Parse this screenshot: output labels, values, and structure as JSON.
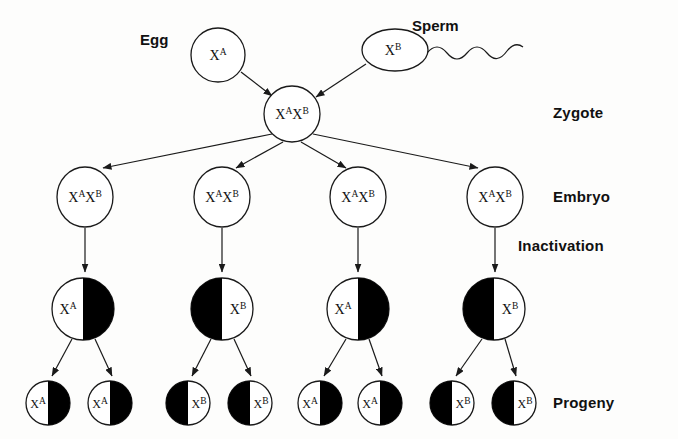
{
  "figure": {
    "background_color": "#fdfdfc",
    "ink_color": "#1a1a1a",
    "inactive_fill_color": "#000000",
    "active_fill_color": "#ffffff"
  },
  "labels": {
    "egg": "Egg",
    "sperm": "Sperm",
    "zygote": "Zygote",
    "embryo": "Embryo",
    "inactivation": "Inactivation",
    "progeny": "Progeny"
  },
  "allele_symbols": {
    "base": "X",
    "a": "A",
    "b": "B"
  },
  "gametes": [
    {
      "id": "egg",
      "base": "X",
      "sup": "A",
      "label": "Egg",
      "shape": "circle"
    },
    {
      "id": "sperm",
      "base": "X",
      "sup": "B",
      "label": "Sperm",
      "shape": "ellipse-with-tail"
    }
  ],
  "zygote": {
    "genotype_parts": [
      {
        "base": "X",
        "sup": "A"
      },
      {
        "base": "X",
        "sup": "B"
      }
    ],
    "label": "Zygote"
  },
  "embryos": [
    {
      "index": 1,
      "genotype_parts": [
        {
          "base": "X",
          "sup": "A"
        },
        {
          "base": "X",
          "sup": "B"
        }
      ]
    },
    {
      "index": 2,
      "genotype_parts": [
        {
          "base": "X",
          "sup": "A"
        },
        {
          "base": "X",
          "sup": "B"
        }
      ]
    },
    {
      "index": 3,
      "genotype_parts": [
        {
          "base": "X",
          "sup": "A"
        },
        {
          "base": "X",
          "sup": "B"
        }
      ]
    },
    {
      "index": 4,
      "genotype_parts": [
        {
          "base": "X",
          "sup": "A"
        },
        {
          "base": "X",
          "sup": "B"
        }
      ]
    }
  ],
  "inactivation_cells": [
    {
      "index": 1,
      "active_allele_base": "X",
      "active_allele_sup": "A",
      "black_half": "right"
    },
    {
      "index": 2,
      "active_allele_base": "X",
      "active_allele_sup": "B",
      "black_half": "left"
    },
    {
      "index": 3,
      "active_allele_base": "X",
      "active_allele_sup": "A",
      "black_half": "right"
    },
    {
      "index": 4,
      "active_allele_base": "X",
      "active_allele_sup": "B",
      "black_half": "left"
    }
  ],
  "progeny_cells": [
    {
      "index": 1,
      "active_allele_base": "X",
      "active_allele_sup": "A",
      "black_half": "right",
      "parent": 1
    },
    {
      "index": 2,
      "active_allele_base": "X",
      "active_allele_sup": "A",
      "black_half": "right",
      "parent": 1
    },
    {
      "index": 3,
      "active_allele_base": "X",
      "active_allele_sup": "B",
      "black_half": "left",
      "parent": 2
    },
    {
      "index": 4,
      "active_allele_base": "X",
      "active_allele_sup": "B",
      "black_half": "left",
      "parent": 2
    },
    {
      "index": 5,
      "active_allele_base": "X",
      "active_allele_sup": "A",
      "black_half": "right",
      "parent": 3
    },
    {
      "index": 6,
      "active_allele_base": "X",
      "active_allele_sup": "A",
      "black_half": "right",
      "parent": 3
    },
    {
      "index": 7,
      "active_allele_base": "X",
      "active_allele_sup": "B",
      "black_half": "left",
      "parent": 4
    },
    {
      "index": 8,
      "active_allele_base": "X",
      "active_allele_sup": "B",
      "black_half": "left",
      "parent": 4
    }
  ],
  "layout": {
    "width": 678,
    "height": 439,
    "egg_circle": {
      "cx": 218,
      "cy": 55,
      "r": 27
    },
    "sperm_ellipse": {
      "cx": 395,
      "cy": 50,
      "rx": 33,
      "ry": 21
    },
    "zygote_circle": {
      "cx": 292,
      "cy": 114,
      "r": 28
    },
    "embryo_row_cy": 197,
    "embryo_r": 27,
    "embryo_cx": [
      85,
      222,
      358,
      495
    ],
    "inactivation_row_cy": 309,
    "inactivation_r": 31,
    "inactivation_cx": [
      83,
      222,
      358,
      494
    ],
    "progeny_row_cy": 403,
    "progeny_r": 22,
    "progeny_cx": [
      48,
      110,
      188,
      250,
      320,
      380,
      452,
      514
    ],
    "label_positions": {
      "egg": {
        "x": 140,
        "y": 31
      },
      "sperm": {
        "x": 412,
        "y": 17
      },
      "zygote": {
        "x": 553,
        "y": 104
      },
      "embryo": {
        "x": 553,
        "y": 188
      },
      "inactivation": {
        "x": 518,
        "y": 237
      },
      "progeny": {
        "x": 553,
        "y": 394
      }
    }
  }
}
